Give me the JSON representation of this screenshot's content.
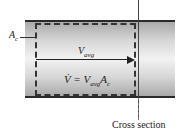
{
  "diagram": {
    "labels": {
      "area": "A",
      "area_sub": "c",
      "velocity": "V",
      "velocity_sub": "avg",
      "equation_lhs": "V̇ = V",
      "equation_sub1": "avg",
      "equation_a": "A",
      "equation_sub2": "c",
      "cross_section": "Cross section"
    },
    "colors": {
      "pipe_wall": "#2a2a2a",
      "pipe_fill_edge": "#a9a9a9",
      "pipe_fill_center": "#f2f2f2",
      "control_volume": "#333333"
    }
  }
}
